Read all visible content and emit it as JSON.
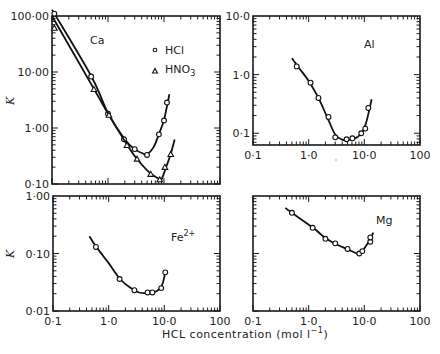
{
  "chart_data": [
    {
      "type": "line",
      "panel": "Ca",
      "title": "Ca",
      "xscale": "log",
      "yscale": "log",
      "xlim": [
        0.1,
        100
      ],
      "ylim": [
        0.1,
        100
      ],
      "xticks": [],
      "yticks": [
        "100·00",
        "10·00",
        "1·00",
        "0·10"
      ],
      "yticks_values": [
        100,
        10,
        1,
        0.1
      ],
      "ylabel": "K",
      "legend": [
        {
          "marker": "circle",
          "label": "HCl"
        },
        {
          "marker": "triangle",
          "label": "HNO",
          "sub": "3"
        }
      ],
      "legend_position": "top-right",
      "series": [
        {
          "name": "HCl",
          "marker": "circle",
          "x": [
            0.11,
            0.5,
            1.0,
            1.93,
            3.0,
            4.97,
            8.1,
            10.0,
            11.3
          ],
          "y": [
            110,
            8.3,
            1.8,
            0.63,
            0.42,
            0.33,
            0.77,
            1.36,
            2.85
          ],
          "curve_x": [
            0.1,
            0.5,
            1.0,
            2.0,
            3.0,
            4.2,
            5.0,
            6.5,
            8.0,
            10.0,
            12.5
          ],
          "curve_y": [
            130,
            8.5,
            1.85,
            0.62,
            0.42,
            0.35,
            0.34,
            0.45,
            0.75,
            1.4,
            4.0
          ]
        },
        {
          "name": "HNO3",
          "marker": "triangle",
          "x": [
            0.11,
            0.56,
            1.04,
            2.18,
            3.3,
            5.8,
            8.4,
            10.4,
            13.2
          ],
          "y": [
            61,
            4.9,
            1.7,
            0.49,
            0.28,
            0.15,
            0.12,
            0.2,
            0.34
          ],
          "curve_x": [
            0.1,
            0.56,
            1.04,
            2.2,
            3.3,
            5.5,
            8.0,
            9.0,
            10.5,
            13.0,
            15.5
          ],
          "curve_y": [
            100,
            5.0,
            1.7,
            0.5,
            0.28,
            0.16,
            0.125,
            0.12,
            0.18,
            0.33,
            0.62
          ]
        }
      ]
    },
    {
      "type": "line",
      "panel": "Al",
      "title": "Al",
      "xscale": "log",
      "yscale": "log",
      "xlim": [
        0.1,
        100
      ],
      "ylim": [
        0.063,
        10
      ],
      "xticks": [
        "0·1",
        "1·0",
        "10·0",
        "100"
      ],
      "xticks_values": [
        0.1,
        1,
        10,
        100
      ],
      "yticks": [
        "10·0",
        "1·0",
        "0·1"
      ],
      "yticks_values": [
        10,
        1,
        0.1
      ],
      "series": [
        {
          "name": "HCl",
          "marker": "circle",
          "x": [
            0.61,
            1.08,
            1.5,
            2.27,
            3.0,
            4.8,
            6.1,
            8.8,
            10.4,
            11.8
          ],
          "y": [
            1.38,
            0.73,
            0.4,
            0.19,
            0.085,
            0.079,
            0.082,
            0.1,
            0.12,
            0.27
          ],
          "curve_x": [
            0.5,
            0.65,
            1.0,
            1.5,
            2.2,
            3.0,
            4.0,
            5.0,
            6.5,
            8.5,
            10.5,
            12.5,
            13.5
          ],
          "curve_y": [
            1.9,
            1.35,
            0.78,
            0.4,
            0.18,
            0.095,
            0.078,
            0.077,
            0.08,
            0.095,
            0.14,
            0.27,
            0.38
          ]
        }
      ]
    },
    {
      "type": "line",
      "panel": "Fe2+",
      "title": "Fe",
      "title_sup": "2+",
      "xscale": "log",
      "yscale": "log",
      "xlim": [
        0.1,
        100
      ],
      "ylim": [
        0.01,
        1.0
      ],
      "xticks": [
        "0·1",
        "1·0",
        "10·0",
        "100"
      ],
      "xticks_values": [
        0.1,
        1,
        10,
        100
      ],
      "yticks": [
        "1·00",
        "0·10",
        "0·01"
      ],
      "yticks_values": [
        1,
        0.1,
        0.01
      ],
      "ylabel": "K",
      "series": [
        {
          "name": "HCl",
          "marker": "circle",
          "x": [
            0.59,
            1.57,
            2.9,
            5.0,
            6.1,
            8.8,
            10.4
          ],
          "y": [
            0.13,
            0.036,
            0.023,
            0.021,
            0.021,
            0.025,
            0.047
          ],
          "curve_x": [
            0.45,
            0.6,
            1.0,
            1.6,
            2.5,
            3.5,
            5.0,
            6.5,
            8.5,
            9.5,
            10.4
          ],
          "curve_y": [
            0.2,
            0.13,
            0.068,
            0.036,
            0.025,
            0.021,
            0.0205,
            0.021,
            0.025,
            0.032,
            0.047
          ]
        }
      ]
    },
    {
      "type": "line",
      "panel": "Mg",
      "title": "Mg",
      "xscale": "log",
      "yscale": "log",
      "xlim": [
        0.1,
        100
      ],
      "ylim": [
        0.01,
        1.0
      ],
      "xticks": [
        "0·1",
        "1·0",
        "10·0",
        "100"
      ],
      "xticks_values": [
        0.1,
        1,
        10,
        100
      ],
      "yticks": [],
      "series": [
        {
          "name": "HCl",
          "marker": "circle",
          "x": [
            0.5,
            1.18,
            2.0,
            3.0,
            5.0,
            8.1,
            9.2,
            12.8,
            12.8
          ],
          "y": [
            0.51,
            0.28,
            0.18,
            0.15,
            0.12,
            0.1,
            0.11,
            0.16,
            0.19
          ],
          "curve_x": [
            0.38,
            0.5,
            1.2,
            2.0,
            3.0,
            5.0,
            7.0,
            8.0,
            9.5,
            12.0,
            14.5
          ],
          "curve_y": [
            0.62,
            0.51,
            0.28,
            0.185,
            0.148,
            0.118,
            0.102,
            0.1,
            0.115,
            0.16,
            0.23
          ]
        }
      ]
    }
  ],
  "shared": {
    "xlabel": "HCL concentration (mol l",
    "xlabel_sup": "−1",
    "xlabel_end": ")"
  }
}
